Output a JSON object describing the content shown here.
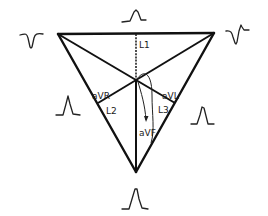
{
  "diagram": {
    "labels": {
      "lead1": "L1",
      "lead2": "L2",
      "lead3": "L3",
      "avr": "aVR",
      "avl": "aVL",
      "avf": "aVF"
    },
    "waveforms": [
      {
        "position": "top",
        "lead": "L1",
        "shape": "upright"
      },
      {
        "position": "top-left",
        "lead": "aVR",
        "shape": "inverted"
      },
      {
        "position": "top-right",
        "lead": "aVL",
        "shape": "biphasic"
      },
      {
        "position": "left",
        "lead": "L2",
        "shape": "upright-tall"
      },
      {
        "position": "right",
        "lead": "L3",
        "shape": "upright"
      },
      {
        "position": "bottom",
        "lead": "aVF",
        "shape": "upright-tall"
      }
    ],
    "colors": {
      "line": "#111111",
      "background": "#ffffff"
    }
  }
}
